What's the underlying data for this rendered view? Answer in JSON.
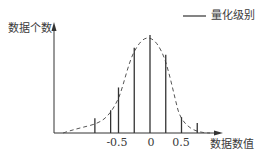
{
  "chart_data": {
    "type": "bar",
    "title": "",
    "xlabel": "数据数值",
    "ylabel": "数据个数",
    "legend": [
      {
        "label": "量化级别",
        "style": "solid-line"
      }
    ],
    "x_ticks": [
      {
        "value": -0.5,
        "label": "-0.5"
      },
      {
        "value": 0,
        "label": "0"
      },
      {
        "value": 0.5,
        "label": "0.5"
      }
    ],
    "categories": [
      -0.875,
      -0.625,
      -0.5,
      -0.25,
      0,
      0.25,
      0.5,
      0.75
    ],
    "series": [
      {
        "name": "量化级别",
        "style": "vertical-stems",
        "values": [
          15,
          23,
          46,
          86,
          99,
          79,
          16,
          10
        ]
      },
      {
        "name": "distribution",
        "style": "dashed-curve",
        "x": [
          -1.4,
          -1.1,
          -0.9,
          -0.7,
          -0.5,
          -0.3,
          -0.15,
          0,
          0.15,
          0.3,
          0.45,
          0.55,
          0.7,
          0.85
        ],
        "values": [
          0,
          4,
          7,
          12,
          33,
          75,
          93,
          95,
          88,
          50,
          14,
          6,
          2,
          0
        ]
      }
    ],
    "grid": false,
    "legend_position": "top-right",
    "yticks_shown": false
  },
  "labels": {
    "legend": "量化级别",
    "y_axis": "数据个数",
    "x_axis": "数据数值",
    "tick_neg": "-0.5",
    "tick_zero": "0",
    "tick_pos": "0.5"
  }
}
